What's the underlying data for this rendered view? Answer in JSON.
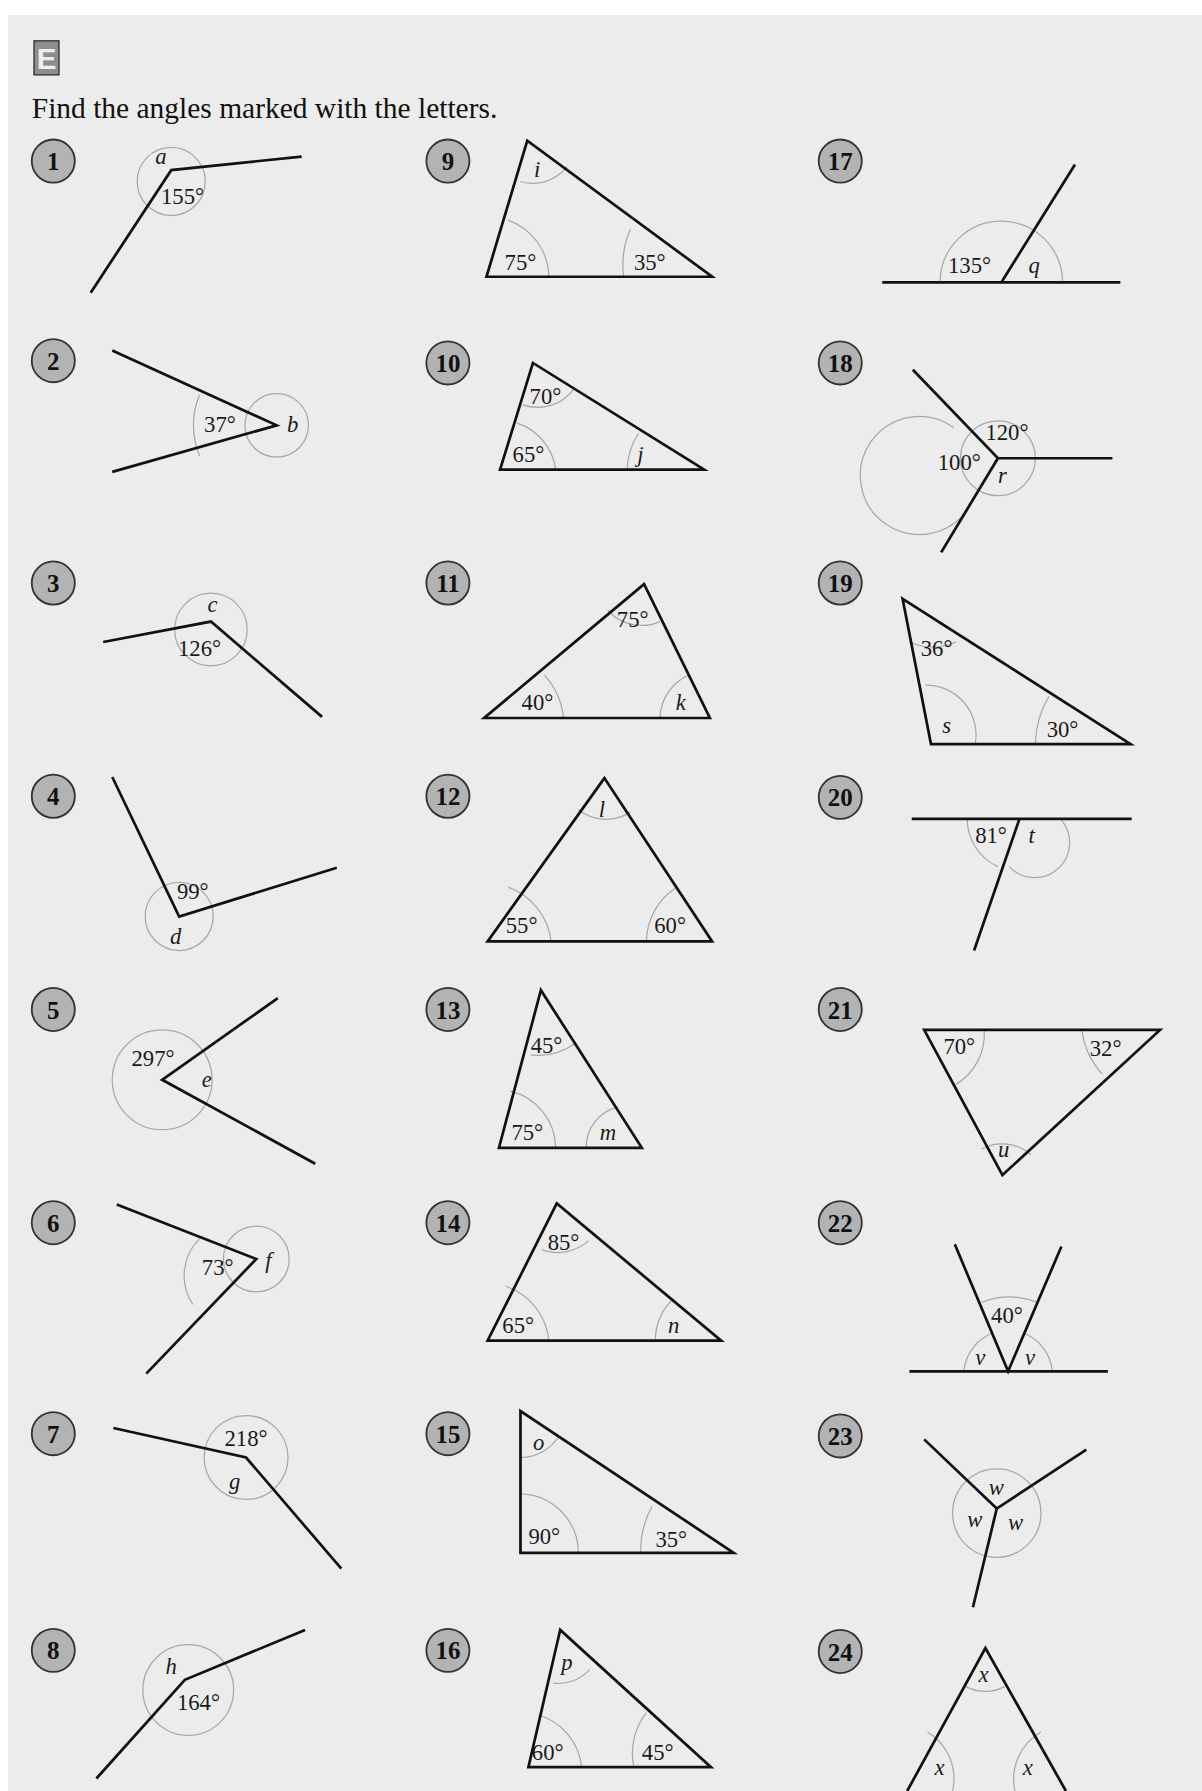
{
  "section_letter": "E",
  "instruction": "Find the angles marked with the letters.",
  "badge_color": "#b3b3b3",
  "problems": [
    {
      "number": "1",
      "labels": [
        "a",
        "155°"
      ]
    },
    {
      "number": "2",
      "labels": [
        "37°",
        "b"
      ]
    },
    {
      "number": "3",
      "labels": [
        "c",
        "126°"
      ]
    },
    {
      "number": "4",
      "labels": [
        "99°",
        "d"
      ]
    },
    {
      "number": "5",
      "labels": [
        "297°",
        "e"
      ]
    },
    {
      "number": "6",
      "labels": [
        "73°",
        "f"
      ]
    },
    {
      "number": "7",
      "labels": [
        "218°",
        "g"
      ]
    },
    {
      "number": "8",
      "labels": [
        "h",
        "164°"
      ]
    },
    {
      "number": "9",
      "labels": [
        "i",
        "75°",
        "35°"
      ]
    },
    {
      "number": "10",
      "labels": [
        "70°",
        "65°",
        "j"
      ]
    },
    {
      "number": "11",
      "labels": [
        "75°",
        "40°",
        "k"
      ]
    },
    {
      "number": "12",
      "labels": [
        "l",
        "55°",
        "60°"
      ]
    },
    {
      "number": "13",
      "labels": [
        "45°",
        "75°",
        "m"
      ]
    },
    {
      "number": "14",
      "labels": [
        "85°",
        "65°",
        "n"
      ]
    },
    {
      "number": "15",
      "labels": [
        "o",
        "90°",
        "35°"
      ]
    },
    {
      "number": "16",
      "labels": [
        "p",
        "60°",
        "45°"
      ]
    },
    {
      "number": "17",
      "labels": [
        "135°",
        "q"
      ]
    },
    {
      "number": "18",
      "labels": [
        "120°",
        "100°",
        "r"
      ]
    },
    {
      "number": "19",
      "labels": [
        "36°",
        "s",
        "30°"
      ]
    },
    {
      "number": "20",
      "labels": [
        "81°",
        "t"
      ]
    },
    {
      "number": "21",
      "labels": [
        "70°",
        "32°",
        "u"
      ]
    },
    {
      "number": "22",
      "labels": [
        "40°",
        "v",
        "v"
      ]
    },
    {
      "number": "23",
      "labels": [
        "w",
        "w",
        "w"
      ]
    },
    {
      "number": "24",
      "labels": [
        "x",
        "x",
        "x"
      ]
    }
  ]
}
